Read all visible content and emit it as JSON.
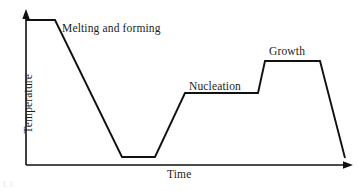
{
  "figure": {
    "kind": "schematic-line-chart",
    "background_color": "#ffffff",
    "line_color": "#111111",
    "text_color": "#1c1c1c",
    "width_px": 359,
    "height_px": 191
  },
  "labels": {
    "melting": "Melting and forming",
    "nucleation": "Nucleation",
    "growth": "Growth",
    "xaxis": "Time",
    "yaxis": "Temperature",
    "corner_artifact": "1.1"
  },
  "chart_data": {
    "type": "line",
    "title": "",
    "subtitle": "",
    "xlabel": "Time",
    "ylabel": "Temperature",
    "xlim": [
      0,
      100
    ],
    "ylim": [
      0,
      100
    ],
    "grid": false,
    "legend": "none",
    "axis_style": "arrow-tipped open axes, no tick marks, no tick labels",
    "tick_labels_x": [],
    "tick_labels_y": [],
    "series": [
      {
        "name": "Thermal profile",
        "x": [
          0,
          8.9,
          29.4,
          39.5,
          48.6,
          71.0,
          73.1,
          90.0,
          97.6
        ],
        "y": [
          93.5,
          93.5,
          5.2,
          5.2,
          46.5,
          46.5,
          67.1,
          67.1,
          4.5
        ],
        "points_px": [
          [
            26,
            20
          ],
          [
            55,
            20
          ],
          [
            122,
            157
          ],
          [
            155,
            157
          ],
          [
            185,
            93
          ],
          [
            258,
            93
          ],
          [
            265,
            61
          ],
          [
            320,
            61
          ],
          [
            345,
            158
          ]
        ]
      }
    ],
    "annotations": [
      {
        "text": "Melting and forming",
        "x": 11.3,
        "y": 86.5,
        "describes": "initial high-temperature hold followed by cooling ramp"
      },
      {
        "text": "Nucleation",
        "x": 48.9,
        "y": 50.5,
        "describes": "intermediate isothermal hold plateau"
      },
      {
        "text": "Growth",
        "x": 74.5,
        "y": 72.5,
        "describes": "upper isothermal hold plateau"
      }
    ],
    "stages": [
      {
        "label": "Melting and forming",
        "segment": "hold then cool"
      },
      {
        "label": "Quench hold",
        "segment": "low-temperature hold"
      },
      {
        "label": "Nucleation",
        "segment": "reheat then hold"
      },
      {
        "label": "Growth",
        "segment": "step up then hold"
      },
      {
        "label": "Final cooling",
        "segment": "cool to ambient"
      }
    ]
  }
}
